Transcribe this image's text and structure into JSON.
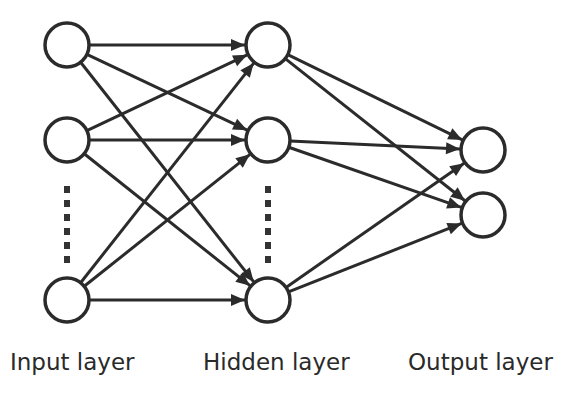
{
  "diagram": {
    "title": "",
    "stroke_color": "#2b2b2b",
    "fill_color": "#ffffff",
    "node_radius": 22,
    "layers": [
      {
        "name": "input",
        "label": "Input layer",
        "x": 67,
        "nodes": [
          {
            "id": "i1",
            "y": 45
          },
          {
            "id": "i2",
            "y": 140
          },
          {
            "id": "i3",
            "y": 300
          }
        ],
        "ellipsis": {
          "x": 67,
          "y1": 186,
          "y2": 258
        }
      },
      {
        "name": "hidden",
        "label": "Hidden layer",
        "x": 268,
        "nodes": [
          {
            "id": "h1",
            "y": 45
          },
          {
            "id": "h2",
            "y": 140
          },
          {
            "id": "h3",
            "y": 300
          }
        ],
        "ellipsis": {
          "x": 268,
          "y1": 186,
          "y2": 258
        }
      },
      {
        "name": "output",
        "label": "Output layer",
        "x": 483,
        "nodes": [
          {
            "id": "o1",
            "y": 150
          },
          {
            "id": "o2",
            "y": 215
          }
        ]
      }
    ],
    "edges": [
      [
        "i1",
        "h1"
      ],
      [
        "i1",
        "h2"
      ],
      [
        "i1",
        "h3"
      ],
      [
        "i2",
        "h1"
      ],
      [
        "i2",
        "h2"
      ],
      [
        "i2",
        "h3"
      ],
      [
        "i3",
        "h1"
      ],
      [
        "i3",
        "h2"
      ],
      [
        "i3",
        "h3"
      ],
      [
        "h1",
        "o1"
      ],
      [
        "h1",
        "o2"
      ],
      [
        "h2",
        "o1"
      ],
      [
        "h2",
        "o2"
      ],
      [
        "h3",
        "o1"
      ],
      [
        "h3",
        "o2"
      ]
    ]
  },
  "labels": {
    "input": "Input layer",
    "hidden": "Hidden layer",
    "output": "Output layer"
  }
}
